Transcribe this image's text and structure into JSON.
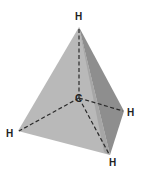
{
  "diagram": {
    "atoms": {
      "center": {
        "label": "C"
      },
      "top": {
        "label": "H"
      },
      "right": {
        "label": "H"
      },
      "left": {
        "label": "H"
      },
      "bottom": {
        "label": "H"
      }
    },
    "colors": {
      "front_face": "#b9b9b9",
      "side_face": "#8e8e8e",
      "bond_line": "#2a2a2a",
      "background": "#ffffff"
    }
  }
}
